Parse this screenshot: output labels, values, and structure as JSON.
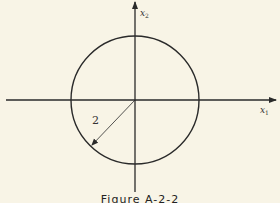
{
  "figure": {
    "caption": "Figure A-2-2",
    "x_axis_label": "x",
    "x_axis_subscript": "1",
    "y_axis_label": "x",
    "y_axis_subscript": "2",
    "radius_label": "2",
    "colors": {
      "background": "#f8f4e6",
      "stroke": "#2a2a2a"
    }
  },
  "diagram": {
    "shape": "circle",
    "center": [
      0,
      0
    ],
    "radius": 2,
    "axes": [
      "x1",
      "x2"
    ]
  }
}
